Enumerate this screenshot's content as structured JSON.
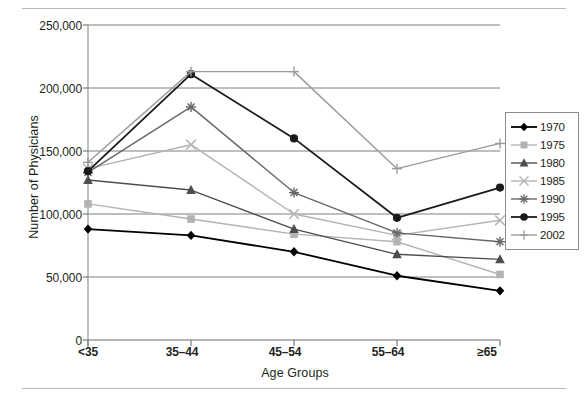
{
  "chart_data": {
    "type": "line",
    "title": "",
    "xlabel": "Age Groups",
    "ylabel": "Number of Physicians",
    "categories": [
      "<35",
      "35–44",
      "45–54",
      "55–64",
      "≥65"
    ],
    "ylim": [
      0,
      250000
    ],
    "ytick_labels": [
      "0",
      "50,000",
      "100,000",
      "150,000",
      "200,000",
      "250,000"
    ],
    "ytick_values": [
      0,
      50000,
      100000,
      150000,
      200000,
      250000
    ],
    "grid": "horizontal",
    "legend_position": "right",
    "series": [
      {
        "name": "1970",
        "marker": "diamond",
        "color": "#000000",
        "values": [
          88000,
          83000,
          70000,
          51000,
          39000
        ]
      },
      {
        "name": "1975",
        "marker": "square",
        "color": "#b3b3b3",
        "values": [
          108000,
          96000,
          84000,
          78000,
          52000
        ]
      },
      {
        "name": "1980",
        "marker": "triangle",
        "color": "#4d4d4d",
        "values": [
          127000,
          119000,
          88000,
          68000,
          64000
        ]
      },
      {
        "name": "1985",
        "marker": "x",
        "color": "#b3b3b3",
        "values": [
          136000,
          155000,
          100000,
          83000,
          95000
        ]
      },
      {
        "name": "1990",
        "marker": "asterisk",
        "color": "#666666",
        "values": [
          133000,
          185000,
          117000,
          85000,
          78000
        ]
      },
      {
        "name": "1995",
        "marker": "circle",
        "color": "#1a1a1a",
        "values": [
          134000,
          211000,
          160000,
          97000,
          121000
        ]
      },
      {
        "name": "2002",
        "marker": "plus",
        "color": "#9b9b9b",
        "values": [
          141000,
          213000,
          213000,
          136000,
          156000
        ]
      }
    ]
  },
  "legend": {
    "entries": [
      "1970",
      "1975",
      "1980",
      "1985",
      "1990",
      "1995",
      "2002"
    ]
  },
  "axes": {
    "y_title": "Number of Physicians",
    "x_title": "Age Groups",
    "y_ticks": [
      "250,000",
      "200,000",
      "150,000",
      "100,000",
      "50,000",
      "0"
    ],
    "x_ticks": [
      "<35",
      "35–44",
      "45–54",
      "55–64",
      "≥65"
    ]
  }
}
